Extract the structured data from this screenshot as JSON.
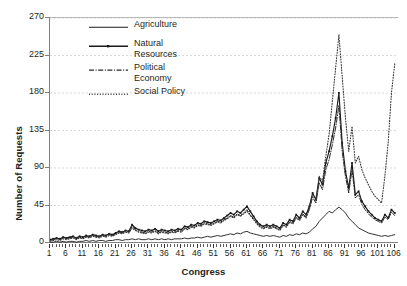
{
  "chart_data": {
    "type": "line",
    "title": "",
    "xlabel": "Congress",
    "ylabel": "Number of Requests",
    "xlim": [
      1,
      107
    ],
    "ylim": [
      0,
      270
    ],
    "yticks": [
      0,
      45,
      90,
      135,
      180,
      225,
      270
    ],
    "xticks": [
      1,
      6,
      11,
      16,
      21,
      26,
      31,
      36,
      41,
      46,
      51,
      56,
      61,
      66,
      71,
      76,
      81,
      86,
      91,
      96,
      101,
      106
    ],
    "grid": "horizontal-dashed",
    "legend_position": "top-center-inside",
    "x": [
      1,
      2,
      3,
      4,
      5,
      6,
      7,
      8,
      9,
      10,
      11,
      12,
      13,
      14,
      15,
      16,
      17,
      18,
      19,
      20,
      21,
      22,
      23,
      24,
      25,
      26,
      27,
      28,
      29,
      30,
      31,
      32,
      33,
      34,
      35,
      36,
      37,
      38,
      39,
      40,
      41,
      42,
      43,
      44,
      45,
      46,
      47,
      48,
      49,
      50,
      51,
      52,
      53,
      54,
      55,
      56,
      57,
      58,
      59,
      60,
      61,
      62,
      63,
      64,
      65,
      66,
      67,
      68,
      69,
      70,
      71,
      72,
      73,
      74,
      75,
      76,
      77,
      78,
      79,
      80,
      81,
      82,
      83,
      84,
      85,
      86,
      87,
      88,
      89,
      90,
      91,
      92,
      93,
      94,
      95,
      96,
      97,
      98,
      99,
      100,
      101,
      102,
      103,
      104,
      105,
      106
    ],
    "series": [
      {
        "name": "Agriculture",
        "style": "solid",
        "color": "#1a1a1a",
        "values": [
          1,
          1,
          2,
          1,
          2,
          1,
          2,
          2,
          1,
          2,
          2,
          3,
          2,
          3,
          2,
          3,
          3,
          2,
          3,
          3,
          4,
          4,
          3,
          4,
          4,
          5,
          4,
          5,
          4,
          4,
          5,
          4,
          5,
          4,
          5,
          4,
          5,
          4,
          5,
          5,
          5,
          6,
          5,
          6,
          6,
          7,
          6,
          7,
          8,
          7,
          8,
          9,
          8,
          9,
          10,
          11,
          10,
          12,
          11,
          13,
          14,
          12,
          11,
          10,
          9,
          8,
          9,
          8,
          9,
          8,
          7,
          9,
          8,
          10,
          9,
          11,
          10,
          12,
          11,
          13,
          17,
          20,
          26,
          30,
          34,
          38,
          36,
          40,
          43,
          40,
          36,
          30,
          26,
          22,
          18,
          16,
          14,
          12,
          11,
          10,
          9,
          8,
          9,
          8,
          9,
          10
        ]
      },
      {
        "name": "Natural Resources",
        "style": "solid-marker",
        "color": "#1a1a1a",
        "values": [
          4,
          5,
          6,
          5,
          7,
          6,
          7,
          8,
          6,
          8,
          7,
          9,
          8,
          10,
          9,
          8,
          10,
          9,
          11,
          10,
          12,
          14,
          13,
          15,
          14,
          22,
          18,
          16,
          15,
          14,
          16,
          15,
          17,
          14,
          16,
          15,
          14,
          16,
          15,
          17,
          16,
          20,
          19,
          22,
          21,
          24,
          23,
          26,
          25,
          24,
          26,
          28,
          27,
          30,
          33,
          36,
          34,
          38,
          36,
          40,
          44,
          38,
          32,
          26,
          22,
          20,
          22,
          20,
          22,
          20,
          18,
          24,
          22,
          28,
          26,
          34,
          30,
          38,
          34,
          44,
          60,
          52,
          78,
          70,
          96,
          110,
          128,
          150,
          180,
          120,
          86,
          66,
          96,
          58,
          62,
          50,
          44,
          38,
          34,
          30,
          28,
          26,
          34,
          30,
          40,
          36
        ]
      },
      {
        "name": "Political Economy",
        "style": "dashdot",
        "color": "#2b2b2b",
        "values": [
          3,
          4,
          5,
          4,
          6,
          5,
          6,
          7,
          5,
          7,
          6,
          8,
          7,
          9,
          8,
          7,
          9,
          8,
          10,
          9,
          11,
          13,
          12,
          14,
          13,
          20,
          16,
          14,
          13,
          12,
          14,
          13,
          15,
          12,
          14,
          13,
          12,
          14,
          13,
          15,
          14,
          18,
          17,
          20,
          19,
          22,
          21,
          24,
          23,
          22,
          24,
          26,
          25,
          28,
          30,
          33,
          31,
          35,
          33,
          36,
          40,
          34,
          29,
          24,
          20,
          18,
          20,
          18,
          20,
          18,
          16,
          22,
          20,
          26,
          24,
          31,
          28,
          35,
          31,
          40,
          55,
          48,
          72,
          64,
          88,
          100,
          118,
          138,
          165,
          110,
          80,
          60,
          88,
          54,
          58,
          46,
          40,
          35,
          31,
          28,
          26,
          24,
          31,
          28,
          37,
          33
        ]
      },
      {
        "name": "Social Policy",
        "style": "dotted",
        "color": "#3a3a3a",
        "values": [
          2,
          3,
          4,
          3,
          5,
          4,
          5,
          6,
          4,
          6,
          5,
          7,
          6,
          8,
          7,
          6,
          8,
          7,
          9,
          8,
          10,
          12,
          11,
          13,
          12,
          18,
          15,
          13,
          12,
          11,
          13,
          12,
          14,
          11,
          13,
          12,
          11,
          13,
          12,
          14,
          13,
          17,
          16,
          19,
          18,
          21,
          20,
          23,
          22,
          21,
          23,
          25,
          24,
          27,
          29,
          32,
          30,
          34,
          32,
          35,
          38,
          33,
          28,
          23,
          19,
          17,
          19,
          17,
          19,
          17,
          15,
          21,
          19,
          25,
          23,
          30,
          27,
          34,
          30,
          42,
          58,
          52,
          80,
          74,
          104,
          130,
          170,
          210,
          250,
          200,
          150,
          110,
          140,
          96,
          104,
          88,
          78,
          70,
          62,
          56,
          52,
          48,
          80,
          120,
          180,
          215
        ]
      }
    ]
  }
}
